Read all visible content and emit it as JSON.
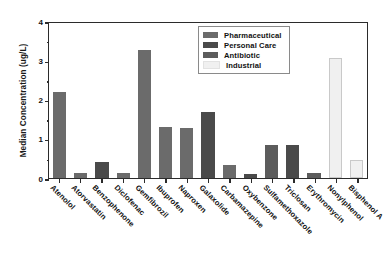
{
  "chart_data": {
    "type": "bar",
    "title": "",
    "xlabel": "",
    "ylabel": "Median Concentration (ug/L)",
    "ylim": [
      0,
      4
    ],
    "yticks": [
      0,
      1,
      2,
      3,
      4
    ],
    "ytick_labels": [
      "0",
      "1",
      "2",
      "3",
      "4"
    ],
    "grid": false,
    "legend_position": "top-center",
    "categories": [
      "Atenolol",
      "Atorvastatin",
      "Benzophenone",
      "Diclofenac",
      "Gemfibrozil",
      "Ibuprofen",
      "Naproxen",
      "Galaxolide",
      "Carbamazepine",
      "Oxybenzone",
      "Sulfamethoxazole",
      "Triclosan",
      "Erythromycin",
      "Nonylphenol",
      "Bisphenol A"
    ],
    "values": [
      2.2,
      0.12,
      0.4,
      0.14,
      3.25,
      1.3,
      1.27,
      1.67,
      0.32,
      0.1,
      0.85,
      0.85,
      0.12,
      3.05,
      0.45
    ],
    "groups": [
      "Pharmaceutical",
      "Pharmaceutical",
      "Personal Care",
      "Pharmaceutical",
      "Pharmaceutical",
      "Pharmaceutical",
      "Pharmaceutical",
      "Personal Care",
      "Pharmaceutical",
      "Personal Care",
      "Antibiotic",
      "Personal Care",
      "Antibiotic",
      "Industrial",
      "Industrial"
    ],
    "legend": [
      {
        "label": "Pharmaceutical",
        "color": "#6b6b6b"
      },
      {
        "label": "Personal Care",
        "color": "#4a4a4a"
      },
      {
        "label": "Antibiotic",
        "color": "#5c5c5c"
      },
      {
        "label": "Industrial",
        "color": "#f0f0f0"
      }
    ],
    "group_colors": {
      "Pharmaceutical": "#6b6b6b",
      "Personal Care": "#4a4a4a",
      "Antibiotic": "#5c5c5c",
      "Industrial": "#f0f0f0"
    }
  }
}
